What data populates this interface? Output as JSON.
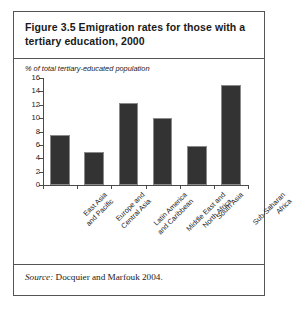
{
  "figure": {
    "title": "Figure 3.5  Emigration rates for those with a tertiary education, 2000",
    "source_word": "Source:",
    "source_text": " Docquier and Marfouk 2004."
  },
  "colors": {
    "bar_fill": "#333333",
    "bar_edge": "#8a8a8a",
    "frame": "#555555",
    "axis": "#4a4a4a",
    "text": "#1a1a1a",
    "background": "#ffffff"
  },
  "chart_data": {
    "type": "bar",
    "title": "Figure 3.5  Emigration rates for those with a tertiary education, 2000",
    "subtitle": "",
    "xlabel": "",
    "ylabel": "% of total tertiary-educated population",
    "categories": [
      "East Asia and Pacific",
      "Europe and Central Asia",
      "Latin America and Caribbean",
      "Middle East and North Africa",
      "South Asia",
      "Sub-Saharan Africa"
    ],
    "category_lines": [
      [
        "East Asia",
        "and Pacific"
      ],
      [
        "Europe and",
        "Central Asia"
      ],
      [
        "Latin America",
        "and Caribbean"
      ],
      [
        "Middle East and",
        "North Africa"
      ],
      [
        "South Asia"
      ],
      [
        "Sub-Saharan",
        "Africa"
      ]
    ],
    "values": [
      7.5,
      5.0,
      12.2,
      10.0,
      5.8,
      15.0
    ],
    "ylim": [
      0,
      16
    ],
    "yticks": [
      0,
      2,
      4,
      6,
      8,
      10,
      12,
      14,
      16
    ],
    "ytick_labels": [
      "0",
      "2",
      "4",
      "6",
      "8",
      "10",
      "12",
      "14",
      "16"
    ],
    "grid": false,
    "legend": false,
    "annotations": [
      "Source: Docquier and Marfouk 2004."
    ]
  }
}
